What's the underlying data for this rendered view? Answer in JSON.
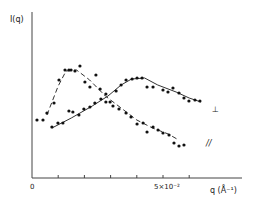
{
  "chart_data": {
    "type": "scatter",
    "title": "",
    "xlabel": "q (Å⁻¹)",
    "ylabel": "I(q)",
    "x_unit_note": "x values in units of 10^-2 Å^-1",
    "xlim": [
      0,
      8
    ],
    "ylim": [
      0,
      166
    ],
    "x_ticks": [
      0,
      1,
      2,
      3,
      4,
      5,
      6
    ],
    "x_tick_labels": [
      {
        "value": 0,
        "label": "0"
      },
      {
        "value": 5,
        "label": "5×10⁻²"
      }
    ],
    "grid": false,
    "legend_position": "inline-right",
    "series": [
      {
        "name": "⊥",
        "line_style": "solid",
        "points": [
          [
            0.76,
            51
          ],
          [
            0.99,
            55
          ],
          [
            1.18,
            55
          ],
          [
            1.41,
            67
          ],
          [
            1.56,
            66
          ],
          [
            1.79,
            63
          ],
          [
            1.98,
            69
          ],
          [
            2.21,
            71
          ],
          [
            2.4,
            75
          ],
          [
            2.63,
            79
          ],
          [
            2.82,
            84
          ],
          [
            2.98,
            76
          ],
          [
            3.21,
            87
          ],
          [
            3.4,
            93
          ],
          [
            3.59,
            98
          ],
          [
            3.82,
            99
          ],
          [
            4.01,
            100
          ],
          [
            4.2,
            100
          ],
          [
            4.39,
            91
          ],
          [
            4.62,
            91
          ],
          [
            5.0,
            88
          ],
          [
            5.19,
            86
          ],
          [
            5.38,
            90
          ],
          [
            5.61,
            85
          ],
          [
            5.8,
            80
          ],
          [
            5.99,
            77
          ],
          [
            6.22,
            78
          ],
          [
            6.41,
            77
          ]
        ],
        "fit_line": [
          [
            0.76,
            50
          ],
          [
            1.5,
            60
          ],
          [
            2.3,
            72
          ],
          [
            2.9,
            82
          ],
          [
            3.4,
            93
          ],
          [
            3.8,
            99
          ],
          [
            4.3,
            100
          ],
          [
            4.8,
            93
          ],
          [
            5.5,
            86
          ],
          [
            6.0,
            80
          ],
          [
            6.45,
            76
          ]
        ]
      },
      {
        "name": "∥",
        "line_style": "dashed",
        "points": [
          [
            0.19,
            58
          ],
          [
            0.42,
            58
          ],
          [
            0.57,
            65
          ],
          [
            0.84,
            75
          ],
          [
            1.03,
            98
          ],
          [
            1.26,
            108
          ],
          [
            1.41,
            108
          ],
          [
            1.49,
            108
          ],
          [
            1.64,
            107
          ],
          [
            1.83,
            112
          ],
          [
            2.02,
            96
          ],
          [
            2.21,
            91
          ],
          [
            2.44,
            103
          ],
          [
            2.6,
            89
          ],
          [
            2.82,
            76
          ],
          [
            3.09,
            72
          ],
          [
            3.32,
            69
          ],
          [
            3.59,
            65
          ],
          [
            3.78,
            61
          ],
          [
            4.01,
            54
          ],
          [
            4.24,
            55
          ],
          [
            4.39,
            46
          ],
          [
            4.62,
            51
          ],
          [
            4.81,
            48
          ],
          [
            5.0,
            45
          ],
          [
            5.23,
            43
          ],
          [
            5.42,
            35
          ],
          [
            5.61,
            32
          ],
          [
            5.8,
            33
          ]
        ],
        "fit_line": [
          [
            0.57,
            63
          ],
          [
            1.0,
            92
          ],
          [
            1.3,
            107
          ],
          [
            1.7,
            108
          ],
          [
            2.2,
            98
          ],
          [
            2.8,
            82
          ],
          [
            3.4,
            70
          ],
          [
            4.0,
            58
          ],
          [
            4.6,
            50
          ],
          [
            5.2,
            44
          ],
          [
            5.6,
            38
          ]
        ]
      }
    ]
  },
  "axes": {
    "y_label": "I(q)",
    "x_label": "q (Å⁻¹)",
    "x_tick_zero": "0",
    "x_tick_five": "5×10⁻²"
  },
  "legend": {
    "perp_symbol": "⊥",
    "para_symbol": "//"
  }
}
